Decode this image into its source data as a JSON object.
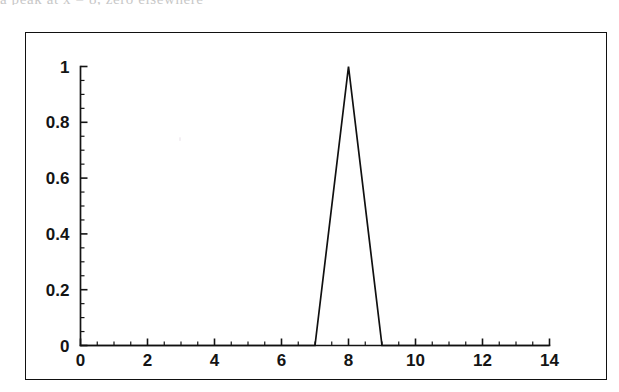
{
  "scan": {
    "top_clipped_text": "a peak at x = 8, zero elsewhere",
    "speck_label": "scan-speck"
  },
  "figure": {
    "frame_label": "figure-frame",
    "background_color": "#ffffff",
    "line_color": "#101010",
    "axis_color": "#141414"
  },
  "chart_data": {
    "type": "line",
    "title": "",
    "subtitle": "",
    "xlabel": "",
    "ylabel": "",
    "xlim": [
      0,
      14
    ],
    "ylim": [
      0,
      1
    ],
    "grid": false,
    "legend": null,
    "x_ticks": [
      0,
      2,
      4,
      6,
      8,
      10,
      12,
      14
    ],
    "x_tick_labels": [
      "0",
      "2",
      "4",
      "6",
      "8",
      "10",
      "12",
      "14"
    ],
    "x_minor_step": 0.5,
    "y_ticks": [
      0,
      0.2,
      0.4,
      0.6,
      0.8,
      1
    ],
    "y_tick_labels": [
      "0",
      "0.2",
      "0.4",
      "0.6",
      "0.8",
      "1"
    ],
    "y_minor_step": 0.05,
    "series": [
      {
        "name": "triangular hat function",
        "x": [
          0,
          7,
          8,
          9,
          14
        ],
        "values": [
          0,
          0,
          1,
          0,
          0
        ],
        "color": "#101010",
        "style": "solid",
        "width": 1.7
      }
    ],
    "annotations": []
  }
}
